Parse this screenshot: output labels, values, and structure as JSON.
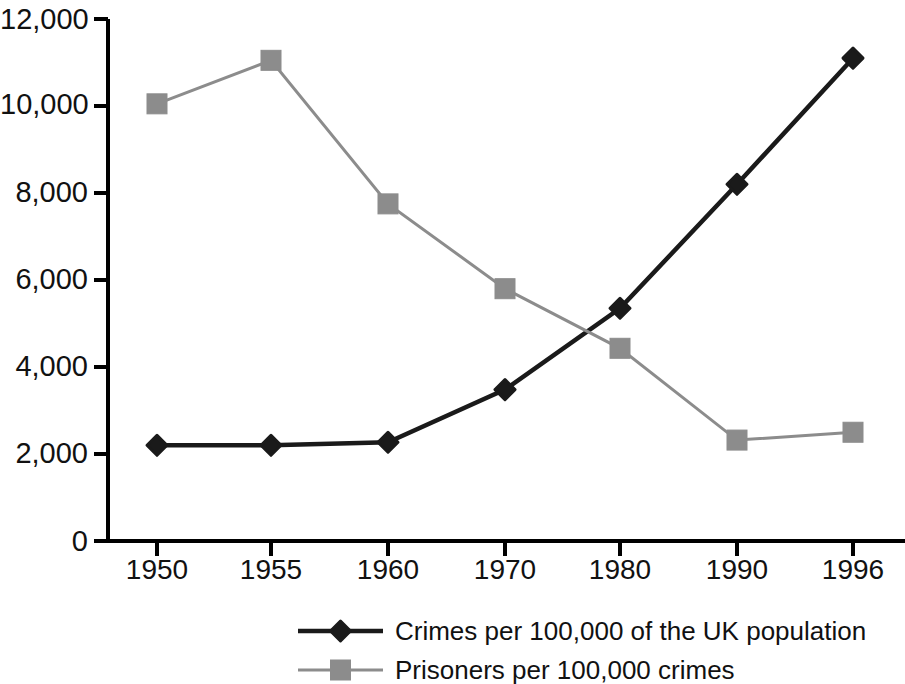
{
  "chart_data": {
    "type": "line",
    "title": "",
    "xlabel": "",
    "ylabel": "",
    "categories": [
      "1950",
      "1955",
      "1960",
      "1970",
      "1980",
      "1990",
      "1996"
    ],
    "x": [
      1950,
      1955,
      1960,
      1970,
      1980,
      1990,
      1996
    ],
    "ylim": [
      0,
      12000
    ],
    "yticks": [
      0,
      2000,
      4000,
      6000,
      8000,
      10000,
      12000
    ],
    "ytick_labels": [
      "0",
      "2,000",
      "4,000",
      "6,000",
      "8,000",
      "10,000",
      "12,000"
    ],
    "xtick_labels": [
      "1950",
      "1955",
      "1960",
      "1970",
      "1980",
      "1990",
      "1996"
    ],
    "grid": false,
    "legend_position": "bottom",
    "series": [
      {
        "name": "Crimes per 100,000 of the UK population",
        "values": [
          2200,
          2200,
          2270,
          3480,
          5350,
          8200,
          11100
        ],
        "color": "#1a1a1a",
        "marker": "diamond"
      },
      {
        "name": "Prisoners per 100,000 crimes",
        "values": [
          10050,
          11050,
          7750,
          5800,
          4430,
          2320,
          2500
        ],
        "color": "#8c8c8c",
        "marker": "square"
      }
    ]
  },
  "axis": {
    "line_color": "#000000"
  },
  "legend": {
    "items": [
      {
        "label": "Crimes per 100,000 of the UK population",
        "color": "#1a1a1a",
        "marker": "diamond"
      },
      {
        "label": "Prisoners per 100,000 crimes",
        "color": "#8c8c8c",
        "marker": "square"
      }
    ]
  }
}
